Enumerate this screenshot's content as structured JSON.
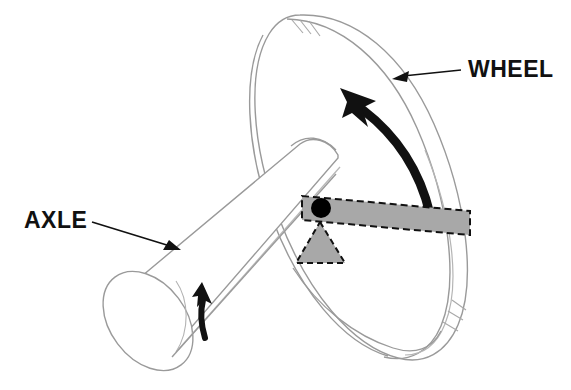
{
  "figure": {
    "type": "technical-line-diagram",
    "background_color": "#ffffff",
    "width": 571,
    "height": 390
  },
  "labels": [
    {
      "id": "wheel",
      "text": "WHEEL",
      "x": 468,
      "y": 77,
      "leader_from": [
        461,
        70
      ],
      "leader_to": [
        396,
        78
      ],
      "points_at": "wheel-rim"
    },
    {
      "id": "axle",
      "text": "AXLE",
      "x": 24,
      "y": 228,
      "leader_from": [
        92,
        222
      ],
      "leader_to": [
        178,
        250
      ],
      "points_at": "axle-cylinder"
    }
  ],
  "parts": {
    "wheel": {
      "name": "wheel",
      "outline_color": "#9a9a9a",
      "fill_color": "#ffffff",
      "line_width": 1.4,
      "description": "Large disc seen in oblique 3D perspective with visible rim thickness and break hatching"
    },
    "axle": {
      "name": "axle",
      "outline_color": "#9a9a9a",
      "fill_color": "#ffffff",
      "line_width": 1.4,
      "description": "Cylindrical shaft running from lower-left to the wheel hub, with elliptical end cap"
    },
    "lever": {
      "name": "lever-bar",
      "fill_color": "#a8a8a8",
      "stroke_color": "#111111",
      "stroke_style": "dashed",
      "description": "Gray dashed-outline bar resting across the pivot, tilted down to the right"
    },
    "fulcrum": {
      "name": "fulcrum-triangle",
      "fill_color": "#a8a8a8",
      "stroke_color": "#111111",
      "stroke_style": "dashed",
      "description": "Gray dashed-outline triangle supporting the lever bar"
    },
    "pivot": {
      "name": "pivot-point",
      "fill_color": "#000000",
      "radius": 10,
      "cx": 321,
      "cy": 208,
      "description": "Solid black circle marking the pivot where the lever meets the fulcrum"
    }
  },
  "arrows": [
    {
      "id": "wheel-rotation",
      "name": "wheel-rotation-arrow",
      "color": "#111111",
      "direction": "counterclockwise",
      "description": "Thick curved arrow sweeping up and to the left along the wheel face"
    },
    {
      "id": "axle-rotation",
      "name": "axle-rotation-arrow",
      "color": "#111111",
      "direction": "counterclockwise",
      "description": "Small thick curved arrow pointing upward around the axle shaft"
    }
  ],
  "colors": {
    "line": "#9a9a9a",
    "ink": "#111111",
    "gray_fill": "#a8a8a8",
    "background": "#ffffff"
  }
}
